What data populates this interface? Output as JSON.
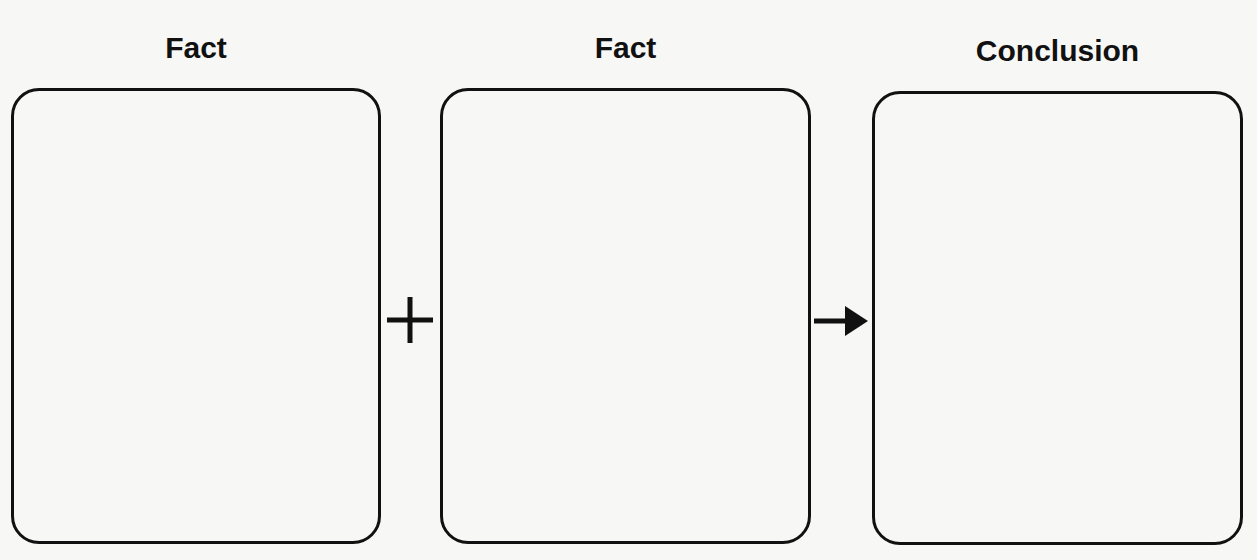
{
  "diagram": {
    "type": "flow",
    "stages": [
      {
        "label": "Fact",
        "content": ""
      },
      {
        "label": "Fact",
        "content": ""
      },
      {
        "label": "Conclusion",
        "content": ""
      }
    ],
    "operators": [
      {
        "name": "plus-icon",
        "symbol": "+"
      },
      {
        "name": "arrow-right-icon",
        "symbol": "→"
      }
    ],
    "colors": {
      "stroke": "#111111",
      "background": "#f7f7f5"
    }
  }
}
